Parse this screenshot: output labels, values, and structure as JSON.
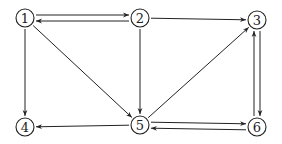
{
  "graph": {
    "type": "directed",
    "node_radius": 9,
    "color": "#222222",
    "nodes": [
      {
        "id": "1",
        "label": "1",
        "x": 25,
        "y": 18
      },
      {
        "id": "2",
        "label": "2",
        "x": 140,
        "y": 18
      },
      {
        "id": "3",
        "label": "3",
        "x": 257,
        "y": 20
      },
      {
        "id": "4",
        "label": "4",
        "x": 25,
        "y": 127
      },
      {
        "id": "5",
        "label": "5",
        "x": 140,
        "y": 125
      },
      {
        "id": "6",
        "label": "6",
        "x": 257,
        "y": 127
      }
    ],
    "edges": [
      {
        "from": "1",
        "to": "2",
        "offset": -3
      },
      {
        "from": "2",
        "to": "1",
        "offset": -3
      },
      {
        "from": "1",
        "to": "4",
        "offset": 0
      },
      {
        "from": "1",
        "to": "5",
        "offset": 0
      },
      {
        "from": "2",
        "to": "3",
        "offset": 0
      },
      {
        "from": "2",
        "to": "5",
        "offset": 0
      },
      {
        "from": "5",
        "to": "3",
        "offset": 0
      },
      {
        "from": "5",
        "to": "4",
        "offset": 0
      },
      {
        "from": "5",
        "to": "6",
        "offset": -3
      },
      {
        "from": "6",
        "to": "5",
        "offset": -3
      },
      {
        "from": "3",
        "to": "6",
        "offset": -3
      },
      {
        "from": "6",
        "to": "3",
        "offset": -3
      }
    ]
  }
}
